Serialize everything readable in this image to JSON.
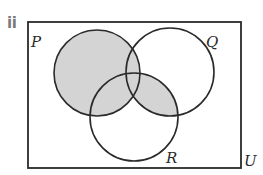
{
  "part_label": "ii",
  "diagram": {
    "type": "venn",
    "universe": {
      "label": "U",
      "x": 28,
      "y": 22,
      "width": 213,
      "height": 146
    },
    "sets": [
      {
        "name": "P",
        "label": "P",
        "cx": 97,
        "cy": 73,
        "r": 43,
        "label_x": 31,
        "label_y": 47
      },
      {
        "name": "Q",
        "label": "Q",
        "cx": 170,
        "cy": 72,
        "r": 44,
        "label_x": 206,
        "label_y": 47
      },
      {
        "name": "R",
        "label": "R",
        "cx": 134,
        "cy": 117,
        "r": 44,
        "label_x": 166,
        "label_y": 163
      }
    ],
    "universe_label_pos": {
      "x": 244,
      "y": 166
    },
    "shaded_region": "P ∪ (Q ∩ R)",
    "colors": {
      "shade": "#d4d4d4",
      "stroke": "#2a2a2a",
      "background": "#ffffff"
    }
  }
}
